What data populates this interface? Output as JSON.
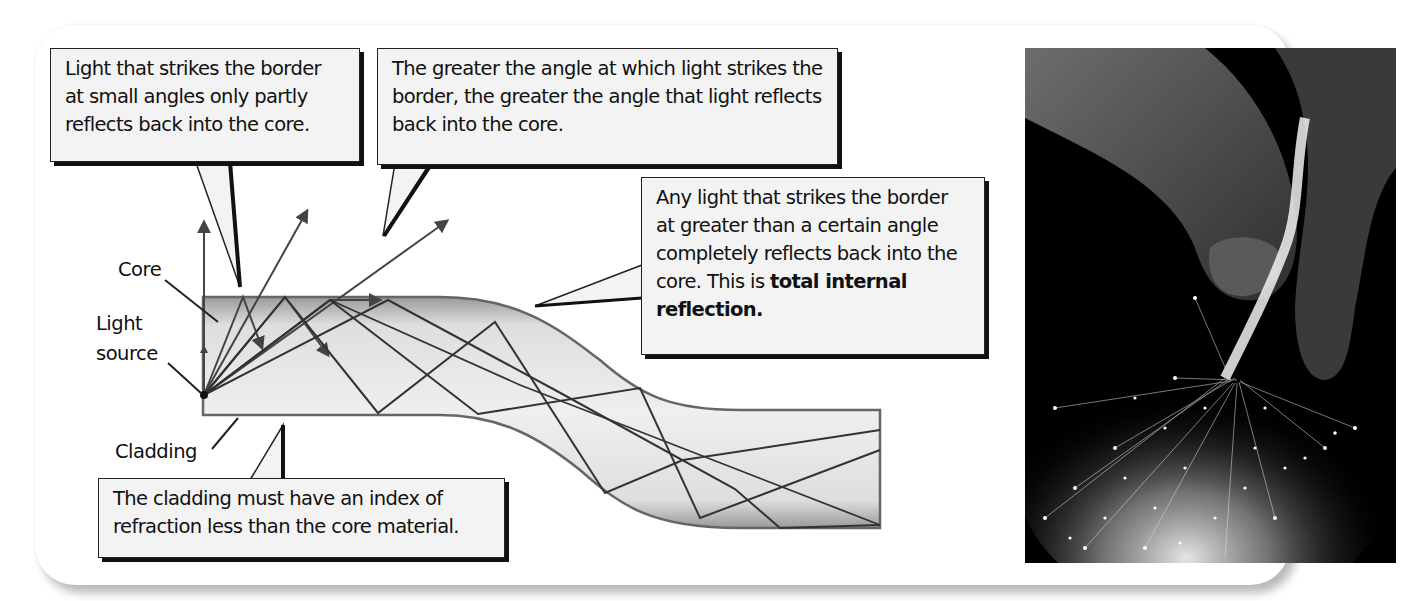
{
  "figure": {
    "callouts": [
      {
        "id": "small-angles",
        "text": "Light that strikes the border at small angles only partly reflects back into the core."
      },
      {
        "id": "greater-angle",
        "text": "The greater the angle at which light strikes the border, the greater the angle that light reflects back into the core."
      },
      {
        "id": "total-internal-reflection",
        "text_plain": "Any light that strikes the border at greater than a certain angle completely reflects back into the core. This is ",
        "text_bold": "total internal reflection."
      },
      {
        "id": "cladding-index",
        "text": "The cladding must have an index of refraction less than the core material."
      }
    ],
    "labels": {
      "core": "Core",
      "light_source_line1": "Light",
      "light_source_line2": "source",
      "cladding": "Cladding"
    },
    "photo": {
      "description": "Hand holding a bundle of glowing optical fibers against a black background"
    },
    "colors": {
      "callout_fill": "#f3f3f3",
      "callout_border": "#222222",
      "fiber_fill": "#e6e6e6",
      "fiber_edge": "#555555",
      "ray": "#333333",
      "photo_bg": "#000000"
    }
  }
}
